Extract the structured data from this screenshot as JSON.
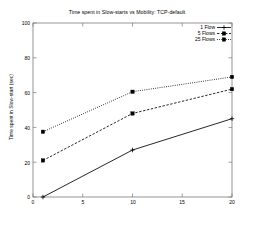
{
  "chart_data": {
    "type": "line",
    "title": "Time spent in Slow-starts vs Mobility: TCP-default",
    "xlabel": "",
    "ylabel": "Time spent in Slow-start (sec)",
    "xlim": [
      0,
      20
    ],
    "ylim": [
      0,
      100
    ],
    "xticks": [
      0,
      5,
      10,
      15,
      20
    ],
    "yticks": [
      0,
      20,
      40,
      60,
      80,
      100
    ],
    "xtick_labels": [
      "0",
      "5",
      "10",
      "15",
      "20"
    ],
    "ytick_labels": [
      "0",
      "20",
      "40",
      "60",
      "80",
      "100"
    ],
    "grid": false,
    "legend_position": "top-right",
    "x": [
      1,
      10,
      20
    ],
    "series": [
      {
        "name": "1 Flow",
        "values": [
          0,
          27,
          45
        ],
        "line_style": "solid",
        "marker": "plus",
        "color": "#000000"
      },
      {
        "name": "5 Flows",
        "values": [
          21,
          48,
          62
        ],
        "line_style": "dashed",
        "marker": "square",
        "color": "#000000"
      },
      {
        "name": "25 Flows",
        "values": [
          37.5,
          60.5,
          69
        ],
        "line_style": "dotted",
        "marker": "square",
        "color": "#000000"
      }
    ]
  },
  "legend": {
    "items": [
      {
        "label": "1 Flow"
      },
      {
        "label": "5 Flows"
      },
      {
        "label": "25 Flows"
      }
    ]
  }
}
